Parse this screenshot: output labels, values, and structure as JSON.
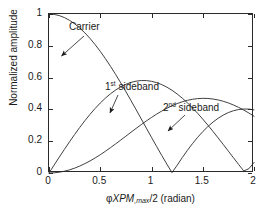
{
  "chart_data": {
    "type": "line",
    "title": "",
    "xlabel": "φXPM,max/2 (radian)",
    "ylabel": "Normalized amplitude",
    "xlim": [
      0,
      2
    ],
    "ylim": [
      0,
      1
    ],
    "xticks": [
      "0",
      "0.5",
      "1",
      "1.5",
      "2"
    ],
    "xtick_values": [
      0,
      0.5,
      1,
      1.5,
      2
    ],
    "yticks": [
      "0",
      "0.2",
      "0.4",
      "0.6",
      "0.8",
      "1"
    ],
    "ytick_values": [
      0,
      0.2,
      0.4,
      0.6,
      0.8,
      1
    ],
    "grid": false,
    "legend": "none",
    "annotations": [
      {
        "text": "Carrier",
        "x": 0.25,
        "y": 0.79,
        "label_x": 0.43,
        "label_y": 0.95
      },
      {
        "text": "1st sideband",
        "x": 0.72,
        "y": 0.33,
        "label_x": 0.72,
        "label_y": 0.6
      },
      {
        "text": "2nd sideband",
        "x": 1.13,
        "y": 0.2,
        "label_x": 1.3,
        "label_y": 0.45
      }
    ],
    "series": [
      {
        "name": "Carrier",
        "x": [
          0,
          0.05,
          0.1,
          0.15,
          0.2,
          0.25,
          0.3,
          0.35,
          0.4,
          0.45,
          0.5,
          0.55,
          0.6,
          0.65,
          0.7,
          0.75,
          0.8,
          0.85,
          0.9,
          0.95,
          1,
          1.05,
          1.1,
          1.15,
          1.2,
          1.25,
          1.3,
          1.35,
          1.4,
          1.45,
          1.5,
          1.55,
          1.6,
          1.65,
          1.7,
          1.75,
          1.8,
          1.85,
          1.9,
          1.95,
          2
        ],
        "values": [
          1,
          0.9975,
          0.99,
          0.9776,
          0.9604,
          0.9385,
          0.912,
          0.8812,
          0.8463,
          0.8075,
          0.7652,
          0.7196,
          0.6711,
          0.6201,
          0.5669,
          0.5118,
          0.4554,
          0.398,
          0.34,
          0.2818,
          0.2239,
          0.1666,
          0.1104,
          0.0555,
          0.0025,
          0.0484,
          0.0969,
          0.1424,
          0.185,
          0.2243,
          0.2601,
          0.2921,
          0.3202,
          0.3443,
          0.3643,
          0.3801,
          0.3918,
          0.3992,
          0.4026,
          0.4018,
          0.3971
        ]
      },
      {
        "name": "1st sideband",
        "x": [
          0,
          0.05,
          0.1,
          0.15,
          0.2,
          0.25,
          0.3,
          0.35,
          0.4,
          0.45,
          0.5,
          0.55,
          0.6,
          0.65,
          0.7,
          0.75,
          0.8,
          0.85,
          0.9,
          0.95,
          1,
          1.05,
          1.1,
          1.15,
          1.2,
          1.25,
          1.3,
          1.35,
          1.4,
          1.45,
          1.5,
          1.55,
          1.6,
          1.65,
          1.7,
          1.75,
          1.8,
          1.85,
          1.9,
          1.95,
          2
        ],
        "values": [
          0,
          0.0499,
          0.0995,
          0.1483,
          0.196,
          0.2423,
          0.2867,
          0.329,
          0.3688,
          0.4059,
          0.4401,
          0.4709,
          0.4983,
          0.522,
          0.5419,
          0.5579,
          0.5699,
          0.5778,
          0.5815,
          0.5812,
          0.5767,
          0.5683,
          0.556,
          0.5399,
          0.5202,
          0.4971,
          0.4708,
          0.4416,
          0.4097,
          0.3754,
          0.3391,
          0.3009,
          0.2613,
          0.2207,
          0.1792,
          0.1374,
          0.0955,
          0.0538,
          0.0128,
          0.0272,
          0.066
        ]
      },
      {
        "name": "2nd sideband",
        "x": [
          0,
          0.05,
          0.1,
          0.15,
          0.2,
          0.25,
          0.3,
          0.35,
          0.4,
          0.45,
          0.5,
          0.55,
          0.6,
          0.65,
          0.7,
          0.75,
          0.8,
          0.85,
          0.9,
          0.95,
          1,
          1.05,
          1.1,
          1.15,
          1.2,
          1.25,
          1.3,
          1.35,
          1.4,
          1.45,
          1.5,
          1.55,
          1.6,
          1.65,
          1.7,
          1.75,
          1.8,
          1.85,
          1.9,
          1.95,
          2
        ],
        "values": [
          0,
          0.0012,
          0.005,
          0.0112,
          0.0197,
          0.0306,
          0.0437,
          0.0588,
          0.0758,
          0.0946,
          0.1149,
          0.1366,
          0.1593,
          0.183,
          0.2072,
          0.2317,
          0.2563,
          0.2806,
          0.3044,
          0.3275,
          0.3496,
          0.3703,
          0.3896,
          0.4072,
          0.4228,
          0.4365,
          0.4479,
          0.457,
          0.4637,
          0.4679,
          0.4696,
          0.4687,
          0.4653,
          0.4594,
          0.4511,
          0.4405,
          0.4276,
          0.4127,
          0.3958,
          0.3772,
          0.3569
        ]
      }
    ],
    "curve_note_peaks": [
      {
        "series": "1st sideband",
        "peak_x": 0.58,
        "peak_y": 0.34
      },
      {
        "series": "2nd sideband",
        "peak_x": 0.97,
        "peak_y": 0.23
      },
      {
        "series": "third hump",
        "peak_x": 1.7,
        "peak_y": 0.12
      }
    ],
    "colors": {
      "line": "#2a2a2a",
      "axis": "#2a2a2a",
      "background": "#ffffff"
    }
  }
}
